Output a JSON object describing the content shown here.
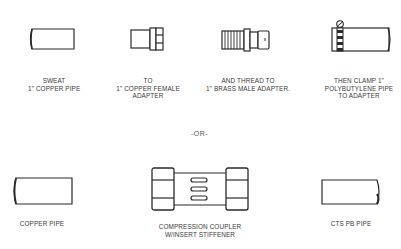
{
  "diagram": {
    "step_sequence": [
      {
        "id": "sweat-copper-pipe",
        "label_lines": [
          "SWEAT",
          "1\" COPPER PIPE"
        ]
      },
      {
        "id": "copper-female-adapter",
        "label_lines": [
          "TO",
          "1\" COPPER FEMALE",
          "ADAPTER"
        ]
      },
      {
        "id": "brass-male-adapter",
        "label_lines": [
          "AND THREAD TO",
          "1\" BRASS MALE ADAPTER."
        ]
      },
      {
        "id": "polybutylene-pipe-clamp",
        "label_lines": [
          "THEN CLAMP 1\"",
          "POLYBUTYLENE PIPE",
          "TO ADAPTER"
        ]
      }
    ],
    "separator": "-OR-",
    "alternative": [
      {
        "id": "copper-pipe",
        "label_lines": [
          "COPPER PIPE"
        ]
      },
      {
        "id": "compression-coupler",
        "label_lines": [
          "COMPRESSION COUPLER",
          "W/INSERT STIFFENER"
        ]
      },
      {
        "id": "cts-pb-pipe",
        "label_lines": [
          "CTS PB PIPE"
        ]
      }
    ],
    "line_color": "#2a2a2a"
  }
}
